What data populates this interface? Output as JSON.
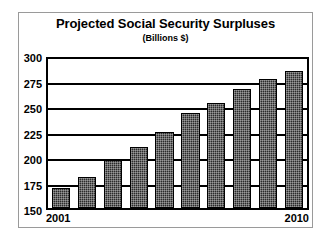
{
  "chart_data": {
    "type": "bar",
    "title": "Projected Social Security Surpluses",
    "subtitle": "(Billions $)",
    "xlabel": "",
    "ylabel": "",
    "ylim": [
      150,
      300
    ],
    "yticks": [
      300,
      275,
      250,
      225,
      200,
      175,
      150
    ],
    "ytick_labels": [
      "300",
      "275",
      "250",
      "225",
      "200",
      "175",
      "150"
    ],
    "grid": true,
    "legend": "none",
    "categories": [
      "2001",
      "2002",
      "2003",
      "2004",
      "2005",
      "2006",
      "2007",
      "2008",
      "2009",
      "2010"
    ],
    "xtick_labels_shown": [
      "2001",
      "2010"
    ],
    "xtick_first": "2001",
    "xtick_last": "2010",
    "values": [
      170,
      181,
      198,
      211,
      227,
      246,
      256,
      270,
      280,
      288
    ],
    "bar_color": "#2b2b2b",
    "bar_edge_color": "#000000",
    "axis_color": "#000000",
    "background_color": "#ffffff",
    "frame_color": "#9a9a9a"
  }
}
